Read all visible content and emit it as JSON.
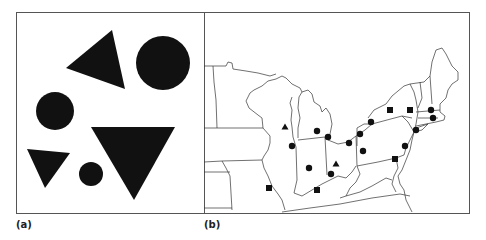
{
  "panels": [
    {
      "label": "(a)",
      "description": "Abstract arrangement of black circles and triangles",
      "shapes": [
        {
          "type": "triangle",
          "points": [
            [
              112,
              30
            ],
            [
              66,
              68
            ],
            [
              125,
              89
            ]
          ]
        },
        {
          "type": "circle",
          "cx": 163,
          "cy": 63,
          "r": 27
        },
        {
          "type": "circle",
          "cx": 55,
          "cy": 111,
          "r": 19
        },
        {
          "type": "triangle",
          "points": [
            [
              27,
              149
            ],
            [
              70,
              153
            ],
            [
              45,
              188
            ]
          ]
        },
        {
          "type": "circle",
          "cx": 91,
          "cy": 174,
          "r": 12
        },
        {
          "type": "triangle",
          "points": [
            [
              91,
              127
            ],
            [
              175,
              127
            ],
            [
              134,
              200
            ]
          ]
        }
      ]
    },
    {
      "label": "(b)",
      "description": "Map of the northeastern / midwestern United States with point symbols",
      "markers": [
        {
          "type": "triangle",
          "x": 285,
          "y": 127
        },
        {
          "type": "circle",
          "x": 292,
          "y": 146
        },
        {
          "type": "circle",
          "x": 317,
          "y": 131
        },
        {
          "type": "circle",
          "x": 328,
          "y": 137
        },
        {
          "type": "circle",
          "x": 309,
          "y": 168
        },
        {
          "type": "triangle",
          "x": 336,
          "y": 164
        },
        {
          "type": "circle",
          "x": 331,
          "y": 174
        },
        {
          "type": "square",
          "x": 269,
          "y": 188
        },
        {
          "type": "square",
          "x": 317,
          "y": 190
        },
        {
          "type": "circle",
          "x": 349,
          "y": 143
        },
        {
          "type": "circle",
          "x": 360,
          "y": 134
        },
        {
          "type": "circle",
          "x": 363,
          "y": 151
        },
        {
          "type": "circle",
          "x": 371,
          "y": 122
        },
        {
          "type": "square",
          "x": 390,
          "y": 110
        },
        {
          "type": "square",
          "x": 410,
          "y": 110
        },
        {
          "type": "circle",
          "x": 431,
          "y": 110
        },
        {
          "type": "circle",
          "x": 433,
          "y": 118
        },
        {
          "type": "circle",
          "x": 416,
          "y": 130
        },
        {
          "type": "circle",
          "x": 405,
          "y": 146
        },
        {
          "type": "square",
          "x": 395,
          "y": 159
        }
      ]
    }
  ],
  "colors": {
    "ink": "#111111",
    "frame": "#555555",
    "lines": "#333333"
  }
}
